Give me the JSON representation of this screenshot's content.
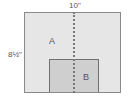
{
  "diagram": {
    "width_label": "10\"",
    "height_label": "8½\"",
    "region_a_label": "A",
    "region_b_label": "B",
    "colors": {
      "outer_fill": "#e6e6e6",
      "inner_fill": "#cfcfcf",
      "outline": "#8a8a8a",
      "dashed_line": "#7a7a7a"
    }
  }
}
